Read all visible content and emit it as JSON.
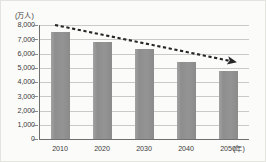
{
  "chart_data": {
    "type": "bar",
    "title": "",
    "categories": [
      "2010",
      "2020",
      "2030",
      "2040",
      "2050"
    ],
    "values": [
      7500,
      6800,
      6300,
      5400,
      4800
    ],
    "xlabel": "(年)",
    "ylabel": "(万人)",
    "ylim": [
      0,
      8000
    ],
    "ytick_values": [
      8000,
      7000,
      6000,
      5000,
      4000,
      3000,
      2000,
      1000,
      0
    ],
    "ytick_labels": [
      "8,000",
      "7,000",
      "6,000",
      "5,000",
      "4,000",
      "3,000",
      "2,000",
      "1,000",
      "0"
    ],
    "grid": true,
    "legend": false,
    "series": [
      {
        "name": "人口",
        "values": [
          7500,
          6800,
          6300,
          5400,
          4800
        ]
      }
    ],
    "annotations": [
      {
        "type": "dashed-trend-arrow",
        "label": "",
        "from_value": 8150,
        "to_value": 5450,
        "direction": "decreasing"
      }
    ],
    "colors": {
      "bar": "#919191",
      "grid": "#c9c9c7",
      "axis": "#6f6f6f",
      "trend": "#262626",
      "background": "#fbfbfa",
      "text": "#3b3b3b"
    }
  }
}
